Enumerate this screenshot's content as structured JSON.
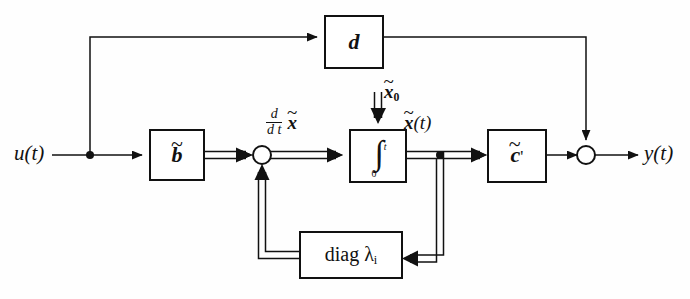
{
  "figure": {
    "background_color": "#fefefe",
    "line_color": "#111111",
    "block_fill": "#ffffff"
  },
  "terminals": {
    "input_label": "u(t)",
    "output_label": "y(t)"
  },
  "blocks": [
    {
      "id": "feedthrough",
      "label": "d",
      "name": "feedthrough-gain-block",
      "x": 325,
      "y": 16,
      "width": 58,
      "height": 52
    },
    {
      "id": "input_vector",
      "label": "b",
      "accent": "~",
      "name": "input-vector-block",
      "x": 150,
      "y": 130,
      "width": 54,
      "height": 50
    },
    {
      "id": "integrator",
      "label": "∫",
      "lower_limit": "0",
      "upper_limit": "t",
      "name": "integrator-block",
      "x": 350,
      "y": 130,
      "width": 56,
      "height": 52
    },
    {
      "id": "output_vector",
      "label": "c",
      "accent": "~",
      "prime": "'",
      "name": "output-vector-block",
      "x": 488,
      "y": 130,
      "width": 58,
      "height": 52
    },
    {
      "id": "state_matrix",
      "label": "diag λ",
      "subscript": "i",
      "name": "diagonal-eigenvalue-block",
      "x": 300,
      "y": 232,
      "width": 102,
      "height": 46
    }
  ],
  "signal_labels": {
    "state_derivative": {
      "numerator": "d",
      "denominator": "d t",
      "variable": "x",
      "accent": "~"
    },
    "initial_state": {
      "variable": "x",
      "accent": "~",
      "subscript": "0"
    },
    "state": {
      "variable": "x",
      "accent": "~",
      "arg": "(t)"
    }
  },
  "junctions": [
    {
      "id": "input_branch",
      "name": "input-branch-node",
      "type": "branch",
      "x": 90,
      "y": 155
    },
    {
      "id": "sum_state",
      "name": "state-summing-junction",
      "type": "summer",
      "x": 262,
      "y": 155,
      "r": 9
    },
    {
      "id": "state_branch",
      "name": "state-branch-node",
      "type": "branch",
      "x": 440,
      "y": 155
    },
    {
      "id": "sum_output",
      "name": "output-summing-junction",
      "type": "summer",
      "x": 586,
      "y": 155,
      "r": 9
    }
  ],
  "signals": [
    {
      "name": "input-to-branch",
      "kind": "scalar"
    },
    {
      "name": "branch-to-feedthrough",
      "kind": "scalar"
    },
    {
      "name": "feedthrough-to-output-sum",
      "kind": "scalar"
    },
    {
      "name": "branch-to-input-vector",
      "kind": "scalar"
    },
    {
      "name": "input-vector-to-state-sum",
      "kind": "vector"
    },
    {
      "name": "state-sum-to-integrator",
      "kind": "vector"
    },
    {
      "name": "initial-state-to-integrator",
      "kind": "vector"
    },
    {
      "name": "integrator-to-state-branch",
      "kind": "vector"
    },
    {
      "name": "state-branch-to-output-vector",
      "kind": "vector"
    },
    {
      "name": "state-branch-to-diag",
      "kind": "vector"
    },
    {
      "name": "diag-to-state-sum",
      "kind": "vector"
    },
    {
      "name": "output-vector-to-output-sum",
      "kind": "scalar"
    },
    {
      "name": "output-sum-to-output",
      "kind": "scalar"
    }
  ]
}
